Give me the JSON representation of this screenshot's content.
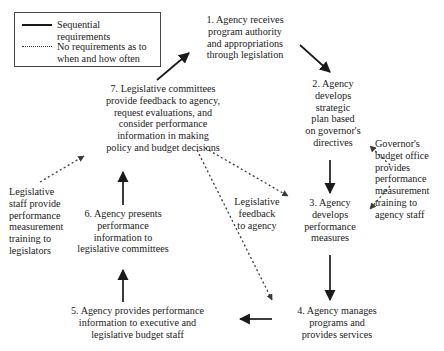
{
  "diagram": {
    "type": "cycle-flowchart",
    "legend": {
      "title": "",
      "items": [
        {
          "style": "solid",
          "icon": "solid-line-icon",
          "label": "Sequential\nrequirements"
        },
        {
          "style": "dotted",
          "icon": "dotted-line-icon",
          "label": "No requirements as to\nwhen and how often"
        }
      ]
    },
    "nodes": [
      {
        "id": "1",
        "label": "1. Agency receives\nprogram authority\nand appropriations\nthrough legislation"
      },
      {
        "id": "2",
        "label": "2. Agency\ndevelops\nstrategic\nplan based\non governor's\ndirectives"
      },
      {
        "id": "3",
        "label": "3. Agency\ndevelops\nperformance\nmeasures"
      },
      {
        "id": "4",
        "label": "4. Agency manages\nprograms and\nprovides services"
      },
      {
        "id": "5",
        "label": "5. Agency provides performance\ninformation to executive and\nlegislative budget staff"
      },
      {
        "id": "6",
        "label": "6. Agency presents\nperformance\ninformation to\nlegislative committees"
      },
      {
        "id": "7",
        "label": "7. Legislative committees\nprovide feedback to agency,\nrequest evaluations, and\nconsider performance\ninformation in making\npolicy and budget decisions"
      }
    ],
    "annotations": [
      {
        "id": "gov-budget-office",
        "label": "Governor's\nbudget office\nprovides\nperformance\nmeasurement\ntraining to\nagency staff"
      },
      {
        "id": "legislative-staff",
        "label": "Legislative\nstaff provide\nperformance\nmeasurement\ntraining to\nlegislators"
      },
      {
        "id": "legislative-feedback",
        "label": "Legislative\nfeedback\nto agency"
      }
    ],
    "edges": [
      {
        "from": "7",
        "to": "1",
        "style": "solid"
      },
      {
        "from": "1",
        "to": "2",
        "style": "solid"
      },
      {
        "from": "2",
        "to": "3",
        "style": "solid"
      },
      {
        "from": "3",
        "to": "4",
        "style": "solid"
      },
      {
        "from": "4",
        "to": "5",
        "style": "solid"
      },
      {
        "from": "5",
        "to": "6",
        "style": "solid"
      },
      {
        "from": "6",
        "to": "7",
        "style": "solid"
      },
      {
        "from": "7",
        "to": "3",
        "style": "dotted"
      },
      {
        "from": "7",
        "to": "4",
        "style": "dotted"
      },
      {
        "from": "gov-budget-office",
        "to": "2",
        "style": "dotted"
      },
      {
        "from": "gov-budget-office",
        "to": "3",
        "style": "dotted"
      },
      {
        "from": "legislative-staff",
        "to": "7",
        "style": "dotted"
      }
    ],
    "colors": {
      "line": "#1a1a1a",
      "dotted_line": "#3a3a3a",
      "text": "#1a1a1a",
      "background": "#ffffff",
      "legend_border": "#4a4540"
    }
  }
}
